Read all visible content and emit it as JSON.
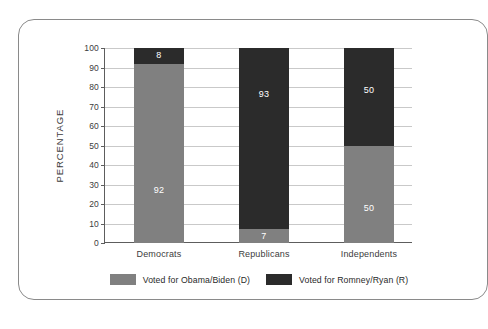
{
  "chart_data": {
    "type": "bar",
    "subtype": "stacked-bar-100",
    "title": "",
    "xlabel": "",
    "ylabel": "PERCENTAGE",
    "ylim": [
      0,
      100
    ],
    "ytick_labels": [
      "100",
      "90",
      "80",
      "70",
      "60",
      "50",
      "40",
      "30",
      "20",
      "10",
      "0"
    ],
    "ytick_values": [
      100,
      90,
      80,
      70,
      60,
      50,
      40,
      30,
      20,
      10,
      0
    ],
    "grid": true,
    "legend_position": "bottom",
    "categories": [
      "Democrats",
      "Republicans",
      "Independents"
    ],
    "series": [
      {
        "name": "Voted for Obama/Biden (D)",
        "color": "#808080",
        "values": [
          92,
          7,
          50
        ]
      },
      {
        "name": "Voted for Romney/Ryan (R)",
        "color": "#2b2b2b",
        "values": [
          8,
          93,
          50
        ]
      }
    ]
  },
  "axis": {
    "y_title": "PERCENTAGE",
    "ticks": [
      {
        "label": "100",
        "value": 100
      },
      {
        "label": "90",
        "value": 90
      },
      {
        "label": "80",
        "value": 80
      },
      {
        "label": "70",
        "value": 70
      },
      {
        "label": "60",
        "value": 60
      },
      {
        "label": "50",
        "value": 50
      },
      {
        "label": "40",
        "value": 40
      },
      {
        "label": "30",
        "value": 30
      },
      {
        "label": "20",
        "value": 20
      },
      {
        "label": "10",
        "value": 10
      },
      {
        "label": "0",
        "value": 0
      }
    ]
  },
  "categories": [
    {
      "label": "Democrats",
      "democrat_value": "92",
      "republican_value": "8"
    },
    {
      "label": "Republicans",
      "democrat_value": "7",
      "republican_value": "93"
    },
    {
      "label": "Independents",
      "democrat_value": "50",
      "republican_value": "50"
    }
  ],
  "legend": {
    "items": [
      {
        "label": "Voted for Obama/Biden (D)",
        "color": "#808080"
      },
      {
        "label": "Voted for Romney/Ryan (R)",
        "color": "#2b2b2b"
      }
    ]
  },
  "colors": {
    "democrat": "#808080",
    "republican": "#2b2b2b",
    "grid": "#c9c9c9",
    "axis": "#5d5d5d",
    "frame": "#8a8a8a",
    "background": "#ffffff"
  }
}
